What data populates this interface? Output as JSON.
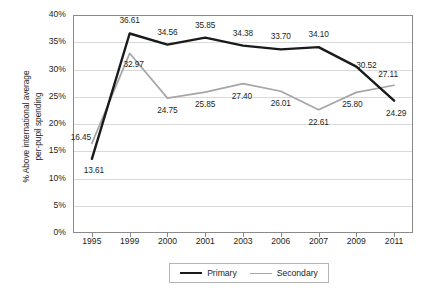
{
  "chart_data": {
    "type": "line",
    "title": "",
    "xlabel": "",
    "ylabel": "% Above international average per-pupil spending",
    "ylabel_line1": "% Above international average",
    "ylabel_line2": "per-pupil spending",
    "categories": [
      "1995",
      "1999",
      "2000",
      "2001",
      "2003",
      "2006",
      "2007",
      "2009",
      "2011"
    ],
    "ylim": [
      0,
      40
    ],
    "ytick_labels": [
      "40%",
      "35%",
      "30%",
      "25%",
      "20%",
      "15%",
      "10%",
      "5%",
      "0%"
    ],
    "ytick_values": [
      40,
      35,
      30,
      25,
      20,
      15,
      10,
      5,
      0
    ],
    "grid": true,
    "legend_position": "bottom",
    "series": [
      {
        "name": "Primary",
        "color": "#1a1a1a",
        "values": [
          13.61,
          36.61,
          34.56,
          35.85,
          34.38,
          33.7,
          34.1,
          30.52,
          24.29
        ],
        "labels": [
          "13.61",
          "36.61",
          "34.56",
          "35.85",
          "34.38",
          "33.70",
          "34.10",
          "30.52",
          "24.29"
        ]
      },
      {
        "name": "Secondary",
        "color": "#a6a6a6",
        "values": [
          16.45,
          32.97,
          24.75,
          25.85,
          27.4,
          26.01,
          22.61,
          25.8,
          27.11
        ],
        "labels": [
          "16.45",
          "32.97",
          "24.75",
          "25.85",
          "27.40",
          "26.01",
          "22.61",
          "25.80",
          "27.11"
        ]
      }
    ]
  },
  "legend": {
    "items": [
      {
        "label": "Primary"
      },
      {
        "label": "Secondary"
      }
    ]
  },
  "colors": {
    "primary_series": "#1a1a1a",
    "secondary_series": "#a6a6a6",
    "gridline": "#d9d9d9",
    "axis": "#8a8a8a",
    "text": "#231f20",
    "background": "#ffffff"
  }
}
